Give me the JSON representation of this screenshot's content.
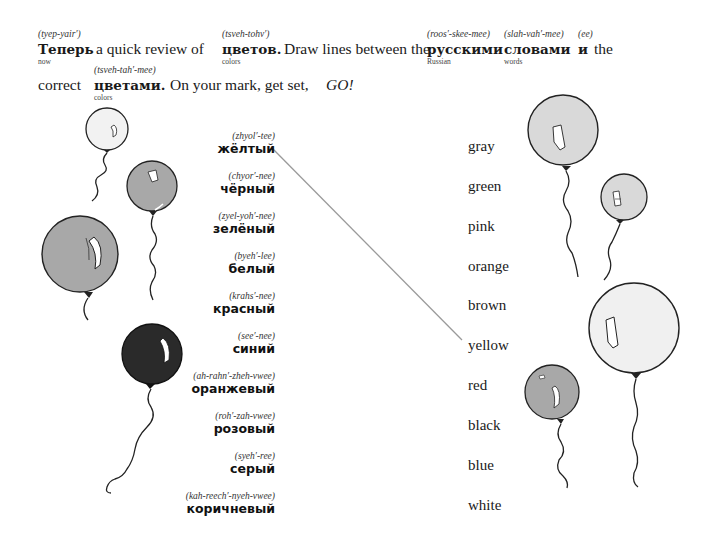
{
  "intro": {
    "line1": {
      "w1": {
        "word": "Теперь",
        "pron": "(tyep-yair′)",
        "gloss": "now"
      },
      "t1": "a quick review of",
      "w2": {
        "word": "цветов.",
        "pron": "(tsveh-tohv′)",
        "gloss": "colors"
      },
      "t2": "Draw lines between the",
      "w3": {
        "word": "русскими",
        "pron": "(roos′-skee-mee)",
        "gloss": "Russian"
      },
      "w4": {
        "word": "словами",
        "pron": "(slah-vah′-mee)",
        "gloss": "words"
      },
      "w5": {
        "word": "и",
        "pron": "(ee)"
      },
      "t3": "the"
    },
    "line2": {
      "t1": "correct",
      "w1": {
        "word": "цветами.",
        "pron": "(tsveh-tah′-mee)",
        "gloss": "colors"
      },
      "t2": "On your mark, get set,",
      "t3": "GO!"
    }
  },
  "russian_words": [
    {
      "pron": "(zhyol′-tee)",
      "word": "жёлтый"
    },
    {
      "pron": "(chyor′-nee)",
      "word": "чёрный"
    },
    {
      "pron": "(zyel-yoh′-nee)",
      "word": "зелёный"
    },
    {
      "pron": "(byeh′-lee)",
      "word": "белый"
    },
    {
      "pron": "(krahs′-nee)",
      "word": "красный"
    },
    {
      "pron": "(see′-nee)",
      "word": "синий"
    },
    {
      "pron": "(ah-rahn′-zheh-vwee)",
      "word": "оранжевый"
    },
    {
      "pron": "(roh′-zah-vwee)",
      "word": "розовый"
    },
    {
      "pron": "(syeh′-ree)",
      "word": "серый"
    },
    {
      "pron": "(kah-reech′-nyeh-vwee)",
      "word": "коричневый"
    }
  ],
  "english_words": [
    "gray",
    "green",
    "pink",
    "orange",
    "brown",
    "yellow",
    "red",
    "black",
    "blue",
    "white"
  ],
  "connections": [
    {
      "from": "жёлтый",
      "to": "yellow"
    }
  ],
  "colors": {
    "ink": "#1a1a1a",
    "line": "#9a9a9a",
    "balloon_light": "#f0f0f0",
    "balloon_lightgray": "#d9d9d9",
    "balloon_mid": "#a8a8a8",
    "balloon_dark": "#2a2a2a"
  }
}
